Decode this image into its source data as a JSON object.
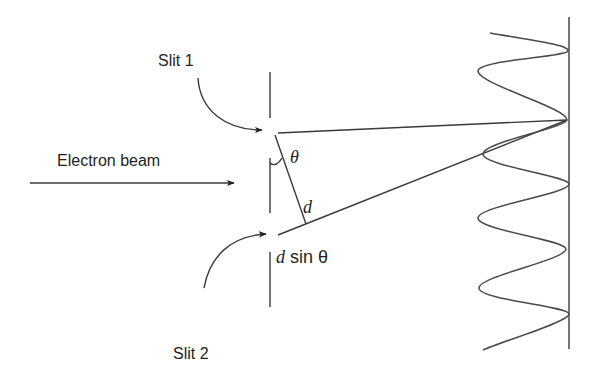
{
  "diagram": {
    "labels": {
      "slit1": "Slit 1",
      "slit2": "Slit 2",
      "beam": "Electron beam",
      "theta": "θ",
      "d": "d",
      "d_sin_prefix": "d",
      "d_sin_suffix": " sin θ"
    },
    "elements": {
      "barrier": {
        "x": 270,
        "segments": [
          [
            72,
            118
          ],
          [
            158,
            213
          ],
          [
            252,
            307
          ]
        ]
      },
      "slit1_point": [
        278,
        133
      ],
      "slit2_point": [
        278,
        235
      ],
      "convergence_point": [
        567,
        120
      ],
      "screen": {
        "x": 569,
        "y_top": 17,
        "y_bottom": 349
      },
      "interference_peaks_y": [
        51,
        120,
        184,
        249,
        314
      ],
      "interference_troughs_y": [
        71,
        154,
        218,
        288
      ]
    },
    "colors": {
      "line": "#3a3a3a",
      "text": "#231f20",
      "background": "#ffffff"
    }
  }
}
